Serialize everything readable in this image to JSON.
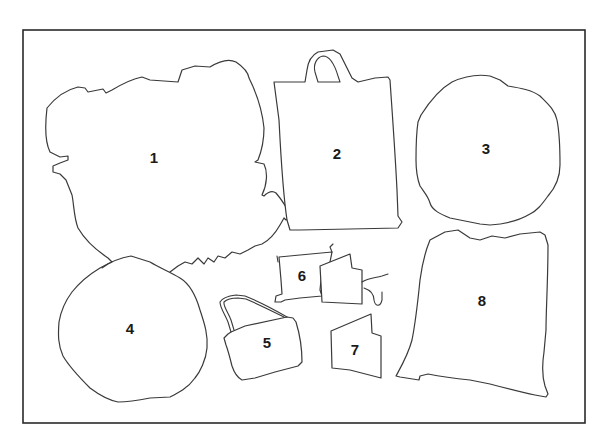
{
  "diagram": {
    "frame": {
      "x": 23,
      "y": 30,
      "width": 562,
      "height": 393
    },
    "items": [
      {
        "id": 1,
        "label": "1",
        "x": 154,
        "y": 157
      },
      {
        "id": 2,
        "label": "2",
        "x": 337,
        "y": 153
      },
      {
        "id": 3,
        "label": "3",
        "x": 486,
        "y": 148
      },
      {
        "id": 4,
        "label": "4",
        "x": 130,
        "y": 328
      },
      {
        "id": 5,
        "label": "5",
        "x": 267,
        "y": 342
      },
      {
        "id": 6,
        "label": "6",
        "x": 302,
        "y": 275
      },
      {
        "id": 7,
        "label": "7",
        "x": 355,
        "y": 349
      },
      {
        "id": 8,
        "label": "8",
        "x": 482,
        "y": 300
      }
    ]
  }
}
